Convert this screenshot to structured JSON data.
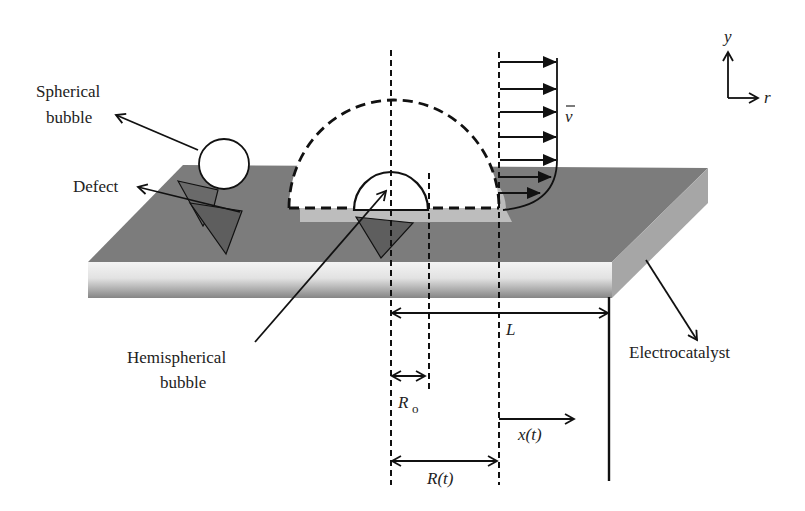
{
  "diagram": {
    "type": "schematic",
    "labels": {
      "spherical_bubble": [
        "Spherical",
        "bubble"
      ],
      "defect": "Defect",
      "hemispherical_bubble": [
        "Hemispherical",
        "bubble"
      ],
      "electrocatalyst": "Electrocatalyst"
    },
    "symbols": {
      "velocity": "v",
      "length": "L",
      "initial_radius": "R",
      "initial_radius_sub": "o",
      "radius_t": "R(t)",
      "position_t": "x(t)",
      "axis_y": "y",
      "axis_r": "r"
    },
    "colors": {
      "surface_top": "#7c7c7c",
      "surface_front_light": "#f2f2f2",
      "surface_front_dark": "#8a8a8a",
      "surface_side": "#a6a6a6",
      "defect_fill": "#5e5e5e",
      "wake_highlight": "#bdbdbd",
      "line": "#111111"
    },
    "flow_profile": {
      "arrow_count": 7,
      "description": "boundary-layer velocity profile, arrows pointing in +r direction"
    }
  }
}
